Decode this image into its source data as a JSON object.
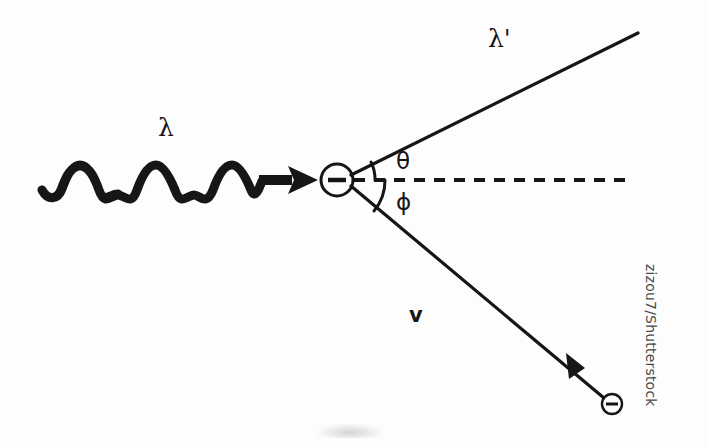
{
  "figure": {
    "title_concept": "compton-scattering-diagram",
    "background_color": "#fdfdfd",
    "ink_color": "#161616"
  },
  "labels": {
    "incident_photon": "λ",
    "scattered_photon": "λ'",
    "scatter_angle": "θ",
    "recoil_angle": "ϕ",
    "electron_velocity": "v",
    "electron_charge_sign": "−"
  },
  "credit": {
    "watermark": "zizou7/Shutterstock"
  },
  "geometry": {
    "origin": {
      "x": 337,
      "y": 180
    },
    "electron_radius": 16,
    "recoil_electron": {
      "x": 612,
      "y": 404,
      "radius": 10
    },
    "incident_wave": {
      "start_x": 42,
      "end_x": 262,
      "baseline_y": 180,
      "amplitude": 14,
      "wavelength": 38
    },
    "arrow_head_tip": {
      "x": 318,
      "y": 180
    },
    "dashed_axis": {
      "x1": 354,
      "y1": 180,
      "x2": 626,
      "y2": 180
    },
    "scattered_ray": {
      "x1": 351,
      "y1": 175,
      "x2": 638,
      "y2": 33,
      "angle_deg": 26
    },
    "recoil_ray": {
      "x1": 351,
      "y1": 186,
      "x2": 604,
      "y2": 398,
      "angle_deg": -40
    },
    "theta_arc_radius": 38,
    "phi_arc_radius": 48
  }
}
